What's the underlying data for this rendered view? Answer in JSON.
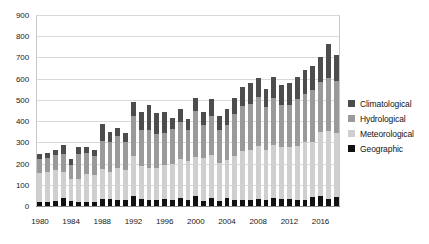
{
  "chart_data": {
    "type": "bar",
    "stacked": true,
    "title": "",
    "xlabel": "",
    "ylabel": "",
    "ylim": [
      0,
      900
    ],
    "ytick_step": 100,
    "yticks": [
      0,
      100,
      200,
      300,
      400,
      500,
      600,
      700,
      800,
      900
    ],
    "grid": true,
    "legend_position": "right",
    "x": [
      1980,
      1981,
      1982,
      1983,
      1984,
      1985,
      1986,
      1987,
      1988,
      1989,
      1990,
      1991,
      1992,
      1993,
      1994,
      1995,
      1996,
      1997,
      1998,
      1999,
      2000,
      2001,
      2002,
      2003,
      2004,
      2005,
      2006,
      2007,
      2008,
      2009,
      2010,
      2011,
      2012,
      2013,
      2014,
      2015,
      2016,
      2017,
      2018
    ],
    "xtick_labels": [
      "1980",
      "1984",
      "1988",
      "1992",
      "1996",
      "2000",
      "2004",
      "2008",
      "2012",
      "2016"
    ],
    "xtick_values": [
      1980,
      1984,
      1988,
      1992,
      1996,
      2000,
      2004,
      2008,
      2012,
      2016
    ],
    "series": [
      {
        "name": "Geographic",
        "color": "#111111",
        "values": [
          20,
          18,
          22,
          40,
          22,
          18,
          20,
          20,
          35,
          32,
          28,
          26,
          45,
          33,
          28,
          30,
          32,
          30,
          36,
          30,
          45,
          25,
          40,
          25,
          38,
          30,
          28,
          30,
          33,
          30,
          36,
          35,
          35,
          28,
          30,
          42,
          48,
          35,
          42
        ]
      },
      {
        "name": "Meteorological",
        "color": "#cfcfcf",
        "values": [
          137,
          140,
          148,
          122,
          105,
          110,
          130,
          125,
          140,
          130,
          150,
          145,
          190,
          155,
          150,
          150,
          160,
          170,
          185,
          180,
          185,
          200,
          200,
          180,
          180,
          205,
          230,
          235,
          250,
          235,
          250,
          245,
          245,
          255,
          270,
          260,
          300,
          320,
          300
        ]
      },
      {
        "name": "Hydrological",
        "color": "#9a9a9a",
        "values": [
          63,
          70,
          72,
          85,
          65,
          118,
          98,
          93,
          130,
          140,
          150,
          130,
          190,
          170,
          180,
          160,
          150,
          165,
          175,
          150,
          220,
          155,
          185,
          155,
          165,
          200,
          215,
          215,
          230,
          200,
          225,
          195,
          195,
          220,
          230,
          245,
          235,
          250,
          245
        ]
      },
      {
        "name": "Climatological",
        "color": "#4d4d4d",
        "values": [
          25,
          22,
          24,
          42,
          28,
          32,
          30,
          27,
          80,
          45,
          42,
          45,
          65,
          85,
          120,
          100,
          100,
          50,
          60,
          50,
          60,
          65,
          80,
          65,
          75,
          75,
          88,
          100,
          90,
          85,
          95,
          95,
          105,
          105,
          110,
          115,
          120,
          160,
          125
        ]
      }
    ],
    "totals": [
      245,
      250,
      266,
      289,
      220,
      278,
      278,
      265,
      385,
      347,
      370,
      346,
      490,
      443,
      478,
      440,
      442,
      415,
      456,
      410,
      510,
      445,
      505,
      425,
      458,
      510,
      561,
      580,
      603,
      550,
      606,
      570,
      580,
      608,
      640,
      662,
      703,
      765,
      712
    ]
  },
  "legend": {
    "items": [
      {
        "label": "Climatological",
        "key": "cli"
      },
      {
        "label": "Hydrological",
        "key": "hyd"
      },
      {
        "label": "Meteorological",
        "key": "met"
      },
      {
        "label": "Geographic",
        "key": "geo"
      }
    ]
  }
}
